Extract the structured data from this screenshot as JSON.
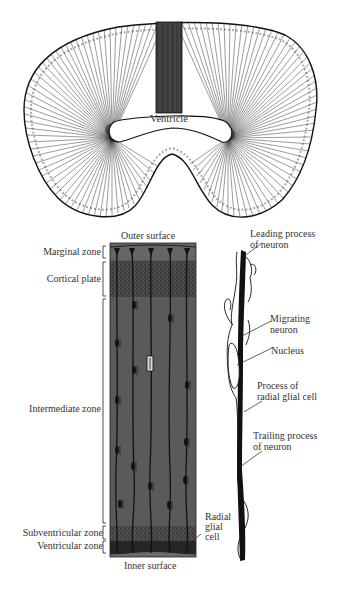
{
  "figure": {
    "top_panel": {
      "ventricle_label": "Ventricle"
    },
    "column_panel": {
      "outer_surface_label": "Outer surface",
      "inner_surface_label": "Inner surface",
      "zones": [
        {
          "id": "marginal",
          "label": "Marginal zone"
        },
        {
          "id": "cortical",
          "label": "Cortical plate"
        },
        {
          "id": "intermediate",
          "label": "Intermediate zone"
        },
        {
          "id": "subventricular",
          "label": "Subventricular zone"
        },
        {
          "id": "ventricular",
          "label": "Ventricular zone"
        }
      ],
      "radial_glial_label": [
        "Radial",
        "glial",
        "cell"
      ]
    },
    "detail_panel": {
      "labels": [
        {
          "id": "leading",
          "lines": [
            "Leading process",
            "of neuron"
          ]
        },
        {
          "id": "migrating",
          "lines": [
            "Migrating",
            "neuron"
          ]
        },
        {
          "id": "nucleus",
          "lines": [
            "Nucleus"
          ]
        },
        {
          "id": "glial_process",
          "lines": [
            "Process of",
            "radial glial cell"
          ]
        },
        {
          "id": "trailing",
          "lines": [
            "Trailing process",
            "of neuron"
          ]
        }
      ]
    },
    "colors": {
      "column_bg": "#5a5a5a",
      "column_dark": "#2e2e2e",
      "ink": "#111111",
      "paper": "#ffffff"
    }
  }
}
